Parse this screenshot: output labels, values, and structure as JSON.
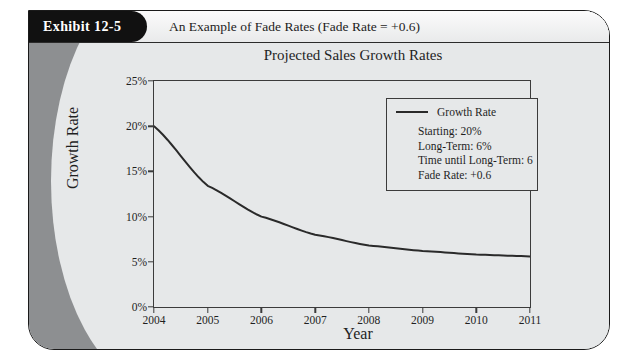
{
  "exhibit": {
    "tab_label": "Exhibit 12-5",
    "header_title": "An Example of Fade Rates (Fade Rate = +0.6)"
  },
  "chart_data": {
    "type": "line",
    "title": "Projected Sales Growth Rates",
    "xlabel": "Year",
    "ylabel": "Growth Rate",
    "categories": [
      "2004",
      "2005",
      "2006",
      "2007",
      "2008",
      "2009",
      "2010",
      "2011"
    ],
    "x": [
      2004,
      2005,
      2006,
      2007,
      2008,
      2009,
      2010,
      2011
    ],
    "series": [
      {
        "name": "Growth Rate",
        "values": [
          20.0,
          13.4,
          10.0,
          8.0,
          6.8,
          6.2,
          5.8,
          5.6
        ],
        "color": "#2a2a2a"
      }
    ],
    "ylim": [
      0,
      25
    ],
    "xlim": [
      2004,
      2011
    ],
    "ytick_labels": [
      "0%",
      "5%",
      "10%",
      "15%",
      "20%",
      "25%"
    ],
    "ytick_values": [
      0,
      5,
      10,
      15,
      20,
      25
    ],
    "grid": false,
    "legend_position": "upper right"
  },
  "legend": {
    "series_label": "Growth Rate",
    "stats": [
      "Starting:  20%",
      "Long-Term:  6%",
      "Time until Long-Term: 6",
      "Fade Rate:  +0.6"
    ]
  }
}
